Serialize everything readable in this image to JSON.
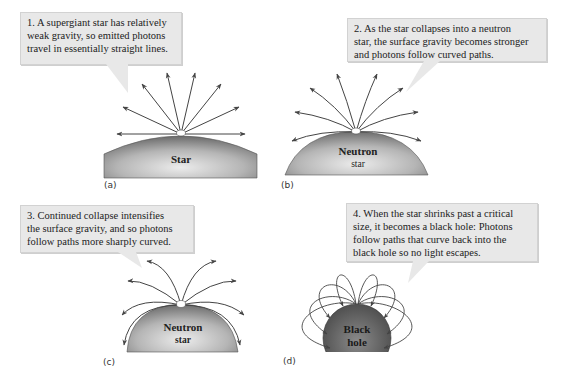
{
  "figure": {
    "panels": [
      {
        "id": "a",
        "label": "(a)",
        "caption": "1. A supergiant star has relatively weak gravity, so emitted photons travel in essentially straight lines.",
        "caption_lines": [
          "1. A supergiant star has relatively",
          "weak gravity, so emitted photons",
          "travel in essentially straight lines."
        ],
        "body_label_lines": [
          "Star"
        ],
        "photon_paths": "straight"
      },
      {
        "id": "b",
        "label": "(b)",
        "caption": "2. As the star collapses into a neutron star, the surface gravity becomes stronger and photons follow curved paths.",
        "caption_lines": [
          "2. As the star collapses into a neutron",
          "star, the surface gravity becomes stronger",
          "and photons follow curved paths."
        ],
        "body_label_lines": [
          "Neutron",
          "star"
        ],
        "photon_paths": "slightly curved"
      },
      {
        "id": "c",
        "label": "(c)",
        "caption": "3. Continued collapse intensifies the surface gravity, and so photons follow paths more sharply curved.",
        "caption_lines": [
          "3. Continued collapse intensifies",
          "the surface gravity, and so photons",
          "follow paths more sharply curved."
        ],
        "body_label_lines": [
          "Neutron",
          "star"
        ],
        "photon_paths": "sharply curved"
      },
      {
        "id": "d",
        "label": "(d)",
        "caption": "4. When the star shrinks past a critical size, it becomes a black hole: Photons follow paths that curve back into the black hole so no light escapes.",
        "caption_lines": [
          "4. When the star shrinks past a critical",
          "size, it becomes a black hole: Photons",
          "follow paths that curve back into the",
          "black hole so no light escapes."
        ],
        "body_label_lines": [
          "Black",
          "hole"
        ],
        "photon_paths": "curve back"
      }
    ],
    "colors": {
      "callout_bg": "#e8e8e8",
      "arrow": "#444444",
      "star_dark": "#6e6e6e",
      "star_light": "#d9d9d9",
      "black_hole": "#555555"
    }
  }
}
